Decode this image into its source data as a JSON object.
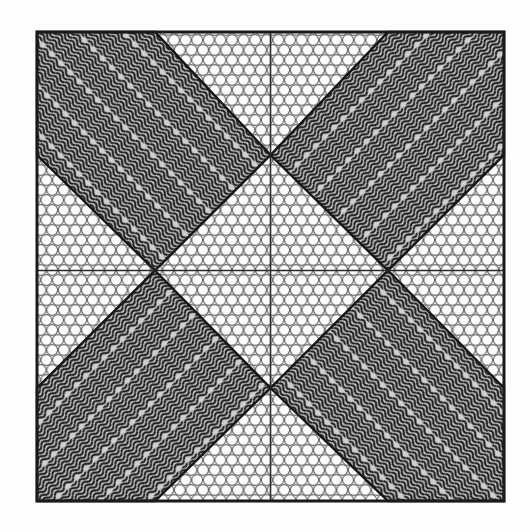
{
  "artwork": {
    "title": "Pinwheel Diamond Quilt Pattern",
    "canvas": {
      "width": 530,
      "height": 532,
      "background_color": "#fdfdfd"
    },
    "frame": {
      "name": "outer-border-frame",
      "x": 37,
      "y": 32,
      "width": 467,
      "height": 469,
      "stroke_color": "#1a1a1a",
      "stroke_width": 3,
      "fill_color": "#f2f2f0"
    },
    "geometry": {
      "center": {
        "x": 270.5,
        "y": 270.5
      },
      "inner_vertices": {
        "left": {
          "x": 155,
          "y": 270.5
        },
        "right": {
          "x": 388,
          "y": 270.5
        },
        "top": {
          "x": 270.5,
          "y": 155
        },
        "bottom": {
          "x": 270.5,
          "y": 388
        }
      }
    },
    "cross_lines": {
      "name": "center-cross-guides",
      "stroke_color": "#2a2a2a",
      "stroke_width": 1.6,
      "vertical": {
        "x": 270.5,
        "y1": 32,
        "y2": 501
      },
      "horizontal": {
        "y": 270.5,
        "x1": 37,
        "x2": 504
      }
    },
    "background_texture": {
      "name": "hexagonal-dot-fill",
      "kind": "hex-packed-circles",
      "circle_fill": "#fbfbfb",
      "circle_stroke": "#6e6e6e",
      "circle_radius": 5.4,
      "spacing_x": 11.6,
      "spacing_y": 10.0,
      "base_color": "#efefed"
    },
    "diamond_texture": {
      "name": "wavy-line-fill",
      "kind": "sinusoidal-stripes",
      "dark_color": "#1e1e1e",
      "light_color": "#cfcfcf",
      "stripe_period": 4.1,
      "wave_amplitude": 1.9,
      "wave_wavelength": 13.0
    },
    "diamonds": [
      {
        "name": "diamond-top-left",
        "position": "top-left",
        "wave_orientation_deg": -45,
        "points": "155,270.5 37,155 37,32 155,32 270.5,155"
      },
      {
        "name": "diamond-top-right",
        "position": "top-right",
        "wave_orientation_deg": 45,
        "points": "270.5,155 388,32 504,32 504,155 388,270.5"
      },
      {
        "name": "diamond-bottom-left",
        "position": "bottom-left",
        "wave_orientation_deg": 45,
        "points": "155,270.5 270.5,388 155,501 37,501 37,388"
      },
      {
        "name": "diamond-bottom-right",
        "position": "bottom-right",
        "wave_orientation_deg": -45,
        "points": "388,270.5 504,388 504,501 388,501 270.5,388"
      }
    ],
    "diamond_outline": {
      "stroke_color": "#161616",
      "stroke_width": 2.4
    }
  }
}
